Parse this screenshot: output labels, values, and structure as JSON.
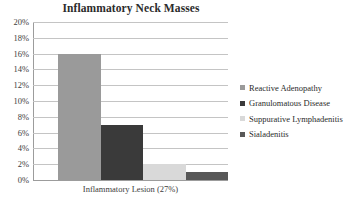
{
  "chart_data": {
    "type": "bar",
    "title": "Inflammatory Neck Masses",
    "xlabel": "Inflammatory Lesion (27%)",
    "ylabel": "",
    "categories": [
      "Inflammatory Lesion (27%)"
    ],
    "ylim": [
      0,
      20
    ],
    "ytick_labels": [
      "20%",
      "18%",
      "16%",
      "14%",
      "12%",
      "10%",
      "8%",
      "6%",
      "4%",
      "2%",
      "0%"
    ],
    "ytick_values": [
      20,
      18,
      16,
      14,
      12,
      10,
      8,
      6,
      4,
      2,
      0
    ],
    "grid": true,
    "legend_position": "right",
    "series": [
      {
        "name": "Reactive Adenopathy",
        "values": [
          16
        ],
        "color": "#9a9a9a"
      },
      {
        "name": "Granulomatous Disease",
        "values": [
          7
        ],
        "color": "#3a3a3a"
      },
      {
        "name": "Suppurative Lymphadenitis",
        "values": [
          2
        ],
        "color": "#d9d9d9"
      },
      {
        "name": "Sialadenitis",
        "values": [
          1
        ],
        "color": "#585858"
      }
    ]
  }
}
